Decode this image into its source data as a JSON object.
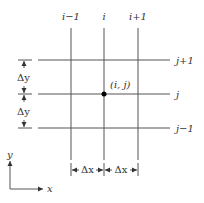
{
  "diagram": {
    "type": "finite-difference grid",
    "columns": [
      {
        "label": "i−1",
        "x": 71
      },
      {
        "label": "i",
        "x": 104
      },
      {
        "label": "i+1",
        "x": 138
      }
    ],
    "rows": [
      {
        "label": "j+1",
        "y": 60
      },
      {
        "label": "j",
        "y": 94
      },
      {
        "label": "j−1",
        "y": 128
      }
    ],
    "node": {
      "label": "(i, j)"
    },
    "spacing": {
      "dy_label": "Δy",
      "dx_label": "Δx"
    },
    "axes": {
      "x_label": "x",
      "y_label": "y"
    },
    "colors": {
      "line": "#555555",
      "text": "#333333",
      "node": "#000000"
    }
  }
}
